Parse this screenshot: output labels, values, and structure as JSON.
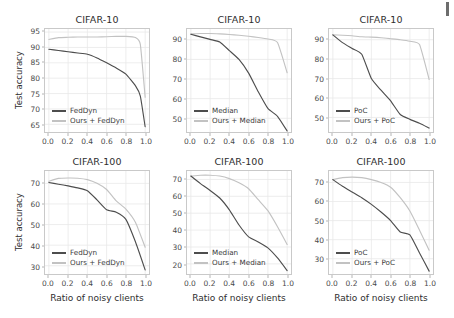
{
  "figure": {
    "ylabel": "Test accuracy",
    "xlabel": "Ratio of noisy clients",
    "corner_mark": "page-edge-mark",
    "colors": {
      "baseline": "#4d4d4d",
      "ours": "#c2c2c2",
      "axis": "#c9c9c9",
      "grid": "#e8e8e8",
      "text": "#2e2e2e"
    }
  },
  "chart_data": [
    {
      "id": "cifar10-feddyn",
      "type": "line",
      "title": "CIFAR-10",
      "xlabel": "",
      "ylabel": "Test accuracy",
      "xlim": [
        -0.04,
        1.04
      ],
      "ylim": [
        62.5,
        96.0
      ],
      "xticks": [
        "0.0",
        "0.2",
        "0.4",
        "0.6",
        "0.8",
        "1.0"
      ],
      "xtickvals": [
        0.0,
        0.2,
        0.4,
        0.6,
        0.8,
        1.0
      ],
      "yticks": [
        "65",
        "70",
        "75",
        "80",
        "85",
        "90",
        "95"
      ],
      "ytickvals": [
        65,
        70,
        75,
        80,
        85,
        90,
        95
      ],
      "grid": true,
      "legend_position": "lower left",
      "x": [
        0.0,
        0.1,
        0.2,
        0.3,
        0.4,
        0.5,
        0.6,
        0.7,
        0.8,
        0.9,
        0.95,
        1.0
      ],
      "series": [
        {
          "name": "FedDyn",
          "color": "#4d4d4d",
          "values": [
            89.4,
            89.0,
            88.6,
            88.2,
            87.8,
            86.6,
            85.0,
            83.3,
            81.3,
            77.5,
            74.2,
            64.2
          ]
        },
        {
          "name": "Ours + FedDyn",
          "color": "#c2c2c2",
          "values": [
            92.6,
            93.2,
            93.3,
            93.4,
            93.4,
            93.4,
            93.5,
            93.6,
            93.6,
            93.2,
            91.0,
            73.8
          ]
        }
      ]
    },
    {
      "id": "cifar10-median",
      "type": "line",
      "title": "CIFAR-10",
      "xlabel": "",
      "ylabel": "",
      "xlim": [
        -0.04,
        1.04
      ],
      "ylim": [
        43.0,
        95.5
      ],
      "xticks": [
        "0.0",
        "0.2",
        "0.4",
        "0.6",
        "0.8",
        "1.0"
      ],
      "xtickvals": [
        0.0,
        0.2,
        0.4,
        0.6,
        0.8,
        1.0
      ],
      "yticks": [
        "50",
        "60",
        "70",
        "80",
        "90"
      ],
      "ytickvals": [
        50,
        60,
        70,
        80,
        90
      ],
      "grid": true,
      "legend_position": "lower left",
      "x": [
        0.0,
        0.1,
        0.2,
        0.3,
        0.4,
        0.5,
        0.6,
        0.7,
        0.8,
        0.9,
        1.0
      ],
      "series": [
        {
          "name": "Median",
          "color": "#4d4d4d",
          "values": [
            92.8,
            91.5,
            90.2,
            88.9,
            84.5,
            80.0,
            73.0,
            63.5,
            55.0,
            51.0,
            43.5
          ]
        },
        {
          "name": "Ours + Median",
          "color": "#c2c2c2",
          "values": [
            93.0,
            93.2,
            93.2,
            93.0,
            92.7,
            92.3,
            91.8,
            91.2,
            90.4,
            88.6,
            73.2
          ]
        }
      ]
    },
    {
      "id": "cifar10-poc",
      "type": "line",
      "title": "CIFAR-10",
      "xlabel": "",
      "ylabel": "",
      "xlim": [
        -0.04,
        1.04
      ],
      "ylim": [
        42.5,
        95.5
      ],
      "xticks": [
        "0.0",
        "0.2",
        "0.4",
        "0.6",
        "0.8",
        "1.0"
      ],
      "xtickvals": [
        0.0,
        0.2,
        0.4,
        0.6,
        0.8,
        1.0
      ],
      "yticks": [
        "50",
        "60",
        "70",
        "80",
        "90"
      ],
      "ytickvals": [
        50,
        60,
        70,
        80,
        90
      ],
      "grid": true,
      "legend_position": "lower left",
      "x": [
        0.0,
        0.1,
        0.2,
        0.3,
        0.4,
        0.5,
        0.6,
        0.7,
        0.8,
        0.9,
        1.0
      ],
      "series": [
        {
          "name": "PoC",
          "color": "#4d4d4d",
          "values": [
            92.5,
            88.5,
            85.5,
            82.5,
            70.0,
            64.0,
            58.5,
            51.5,
            49.0,
            47.0,
            44.5
          ]
        },
        {
          "name": "Ours + PoC",
          "color": "#c2c2c2",
          "values": [
            92.5,
            92.3,
            92.0,
            91.5,
            91.3,
            91.0,
            90.5,
            90.0,
            89.2,
            87.5,
            69.5
          ]
        }
      ]
    },
    {
      "id": "cifar100-feddyn",
      "type": "line",
      "title": "CIFAR-100",
      "xlabel": "Ratio of noisy clients",
      "ylabel": "Test accuracy",
      "xlim": [
        -0.04,
        1.04
      ],
      "ylim": [
        26.0,
        76.0
      ],
      "xticks": [
        "0.0",
        "0.2",
        "0.4",
        "0.6",
        "0.8",
        "1.0"
      ],
      "xtickvals": [
        0.0,
        0.2,
        0.4,
        0.6,
        0.8,
        1.0
      ],
      "yticks": [
        "30",
        "40",
        "50",
        "60",
        "70"
      ],
      "ytickvals": [
        30,
        40,
        50,
        60,
        70
      ],
      "grid": true,
      "legend_position": "lower left",
      "x": [
        0.0,
        0.1,
        0.2,
        0.3,
        0.4,
        0.5,
        0.6,
        0.7,
        0.8,
        0.9,
        1.0
      ],
      "series": [
        {
          "name": "FedDyn",
          "color": "#4d4d4d",
          "values": [
            70.4,
            69.6,
            68.8,
            67.8,
            66.4,
            62.0,
            57.2,
            56.0,
            52.5,
            41.5,
            28.0
          ]
        },
        {
          "name": "Ours + FedDyn",
          "color": "#c2c2c2",
          "values": [
            71.0,
            72.4,
            72.6,
            72.5,
            71.8,
            70.0,
            67.0,
            61.5,
            57.5,
            51.0,
            39.0
          ]
        }
      ]
    },
    {
      "id": "cifar100-median",
      "type": "line",
      "title": "CIFAR-100",
      "xlabel": "Ratio of noisy clients",
      "ylabel": "",
      "xlim": [
        -0.04,
        1.04
      ],
      "ylim": [
        14.0,
        75.0
      ],
      "xticks": [
        "0.0",
        "0.2",
        "0.4",
        "0.6",
        "0.8",
        "1.0"
      ],
      "xtickvals": [
        0.0,
        0.2,
        0.4,
        0.6,
        0.8,
        1.0
      ],
      "yticks": [
        "20",
        "30",
        "40",
        "50",
        "60",
        "70"
      ],
      "ytickvals": [
        20,
        30,
        40,
        50,
        60,
        70
      ],
      "grid": true,
      "legend_position": "lower left",
      "x": [
        0.0,
        0.1,
        0.2,
        0.3,
        0.4,
        0.5,
        0.6,
        0.7,
        0.8,
        0.9,
        1.0
      ],
      "series": [
        {
          "name": "Median",
          "color": "#4d4d4d",
          "values": [
            72.0,
            67.5,
            63.5,
            59.0,
            52.0,
            43.0,
            36.0,
            33.0,
            29.5,
            23.5,
            16.0
          ]
        },
        {
          "name": "Ours + Median",
          "color": "#c2c2c2",
          "values": [
            72.0,
            72.5,
            72.5,
            72.0,
            70.5,
            68.0,
            64.5,
            58.0,
            51.5,
            42.0,
            31.5
          ]
        }
      ]
    },
    {
      "id": "cifar100-poc",
      "type": "line",
      "title": "CIFAR-100",
      "xlabel": "Ratio of noisy clients",
      "ylabel": "",
      "xlim": [
        -0.04,
        1.04
      ],
      "ylim": [
        22.0,
        76.0
      ],
      "xticks": [
        "0.0",
        "0.2",
        "0.4",
        "0.6",
        "0.8",
        "1.0"
      ],
      "xtickvals": [
        0.0,
        0.2,
        0.4,
        0.6,
        0.8,
        1.0
      ],
      "yticks": [
        "30",
        "40",
        "50",
        "60",
        "70"
      ],
      "ytickvals": [
        30,
        40,
        50,
        60,
        70
      ],
      "grid": true,
      "legend_position": "lower left",
      "x": [
        0.0,
        0.1,
        0.2,
        0.3,
        0.4,
        0.5,
        0.6,
        0.7,
        0.8,
        0.9,
        1.0
      ],
      "series": [
        {
          "name": "PoC",
          "color": "#4d4d4d",
          "values": [
            71.5,
            68.0,
            65.0,
            62.0,
            58.5,
            54.5,
            50.0,
            44.0,
            42.5,
            33.0,
            23.5
          ]
        },
        {
          "name": "Ours + PoC",
          "color": "#c2c2c2",
          "values": [
            71.5,
            72.5,
            72.8,
            72.5,
            71.5,
            70.0,
            67.5,
            62.0,
            55.0,
            45.0,
            34.5
          ]
        }
      ]
    }
  ]
}
